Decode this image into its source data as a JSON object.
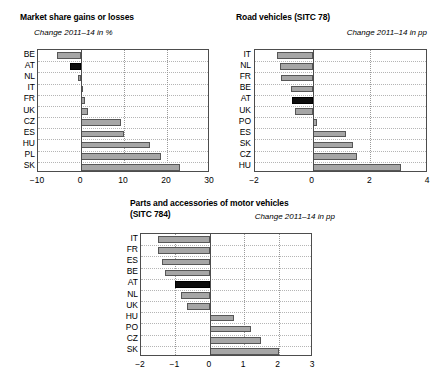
{
  "figure": {
    "width": 436,
    "height": 387,
    "background": "#ffffff",
    "bar_fill": "#a6a6a6",
    "bar_edge": "#565656",
    "highlight_fill": "#0d0d0d",
    "highlight_country": "AT"
  },
  "charts": [
    {
      "id": "market-share",
      "chart_data": {
        "type": "bar",
        "orientation": "horizontal",
        "title": "Market share gains or losses",
        "subtitle": "Change 2011–14 in %",
        "xlabel": "",
        "ylabel": "",
        "xlim": [
          -10,
          30
        ],
        "xticks": [
          -10,
          0,
          10,
          20,
          30
        ],
        "xticklabels": [
          "−10",
          "0",
          "10",
          "20",
          "30"
        ],
        "grid": true,
        "legend": "none",
        "categories": [
          "BE",
          "AT",
          "NL",
          "IT",
          "FR",
          "UK",
          "CZ",
          "ES",
          "HU",
          "PL",
          "SK"
        ],
        "values": [
          -5.5,
          -2.6,
          -0.6,
          -0.1,
          1.0,
          1.6,
          9.4,
          9.9,
          16.0,
          18.5,
          23.0
        ],
        "highlighted": [
          "AT"
        ]
      }
    },
    {
      "id": "road-vehicles",
      "chart_data": {
        "type": "bar",
        "orientation": "horizontal",
        "title": "Road vehicles (SITC 78)",
        "subtitle": "Change 2011–14 in pp",
        "xlabel": "",
        "ylabel": "",
        "xlim": [
          -2,
          4
        ],
        "xticks": [
          -2,
          0,
          2,
          4
        ],
        "xticklabels": [
          "−2",
          "0",
          "2",
          "4"
        ],
        "grid": true,
        "legend": "none",
        "categories": [
          "IT",
          "NL",
          "FR",
          "BE",
          "AT",
          "UK",
          "PO",
          "ES",
          "SK",
          "CZ",
          "HU"
        ],
        "values": [
          -1.25,
          -1.15,
          -1.1,
          -0.75,
          -0.7,
          -0.6,
          0.15,
          1.15,
          1.4,
          1.55,
          3.05
        ],
        "highlighted": [
          "AT"
        ]
      }
    },
    {
      "id": "parts-accessories",
      "chart_data": {
        "type": "bar",
        "orientation": "horizontal",
        "title": "Parts and accessories of motor vehicles (SITC 784)",
        "title_line1": "Parts and accessories of motor vehicles",
        "title_line2": "(SITC 784)",
        "subtitle": "Change 2011–14 in pp",
        "xlabel": "",
        "ylabel": "",
        "xlim": [
          -2,
          3
        ],
        "xticks": [
          -2,
          -1,
          0,
          1,
          2,
          3
        ],
        "xticklabels": [
          "−2",
          "−1",
          "0",
          "1",
          "2",
          "3"
        ],
        "grid": true,
        "legend": "none",
        "categories": [
          "IT",
          "FR",
          "ES",
          "BE",
          "AT",
          "NL",
          "UK",
          "HU",
          "PO",
          "CZ",
          "SK"
        ],
        "values": [
          -1.5,
          -1.5,
          -1.4,
          -1.3,
          -1.0,
          -0.85,
          -0.65,
          0.7,
          1.2,
          1.5,
          2.0
        ],
        "highlighted": [
          "AT"
        ]
      }
    }
  ]
}
